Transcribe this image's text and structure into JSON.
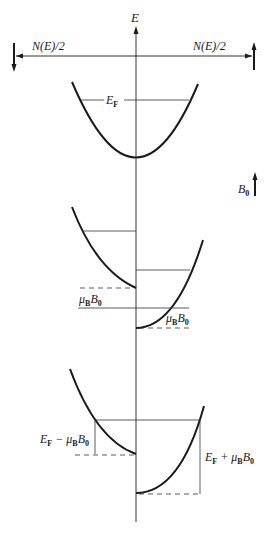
{
  "axes": {
    "y_label": "E",
    "left_label": "N(E)/2",
    "right_label": "N(E)/2"
  },
  "field": {
    "label": "B",
    "label_sub": "0"
  },
  "panel1": {
    "fermi_label": "E",
    "fermi_sub": "F"
  },
  "panel2": {
    "shift_label_left": "μ",
    "shift_label_left_sub": "B",
    "shift_label_left_b": "B",
    "shift_label_left_b_sub": "0",
    "shift_label_right": "μ",
    "shift_label_right_sub": "B",
    "shift_label_right_b": "B",
    "shift_label_right_b_sub": "0"
  },
  "panel3": {
    "left_label": {
      "E": "E",
      "E_sub": "F",
      "op": " − μ",
      "mu_sub": "B",
      "B": "B",
      "B_sub": "0"
    },
    "right_label": {
      "E": "E",
      "E_sub": "F",
      "op": " + μ",
      "mu_sub": "B",
      "B": "B",
      "B_sub": "0"
    }
  },
  "colors": {
    "line": "#1a1a1a",
    "thin": "#333333"
  }
}
